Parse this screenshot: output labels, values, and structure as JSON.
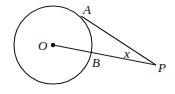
{
  "diagram": {
    "type": "geometry-tangent-secant",
    "stroke_color": "#1a1a1a",
    "background": "#ffffff",
    "circle": {
      "center_label": "O",
      "cx": 53,
      "cy": 45,
      "r": 39
    },
    "points": {
      "O": {
        "label": "O",
        "x": 53,
        "y": 45,
        "label_x": 38,
        "label_y": 50
      },
      "A": {
        "label": "A",
        "x": 81,
        "y": 16,
        "label_x": 83,
        "label_y": 14
      },
      "B": {
        "label": "B",
        "x": 91,
        "y": 52,
        "label_x": 92,
        "label_y": 67
      },
      "P": {
        "label": "P",
        "x": 156,
        "y": 65,
        "label_x": 158,
        "label_y": 72
      }
    },
    "segments": [
      {
        "from": "A",
        "to": "P",
        "description": "tangent from P touching circle at A"
      },
      {
        "from": "O",
        "to": "P",
        "description": "line from center O to P through B"
      }
    ],
    "angle": {
      "label": "x",
      "vertex": "P",
      "between": [
        "A",
        "B"
      ],
      "label_x": 124,
      "label_y": 58
    }
  }
}
